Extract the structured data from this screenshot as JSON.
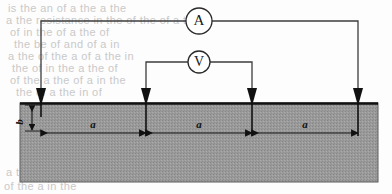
{
  "figure": {
    "ammeter_label": "A",
    "voltmeter_label": "V",
    "spacing_label": "a",
    "depth_label": "b",
    "spacings": [
      "a",
      "a",
      "a"
    ],
    "colors": {
      "ground_fill": "#9a9a9a",
      "ground_stipple": "#8c8c8c",
      "ground_border": "#5a5a5a",
      "surface_line": "#111111",
      "wire": "#3c3c3c",
      "electrode": "#111111",
      "dimension_line": "#111111",
      "page_background": "#fdfdfd",
      "ghost_text": "#c9c9c9"
    },
    "geometry": {
      "ground_rect": {
        "x": 20,
        "y": 103,
        "width": 358,
        "height": 79
      },
      "surface_y": 103,
      "electrodes_x": [
        41,
        146,
        252,
        358
      ],
      "ammeter_circle": {
        "cx": 199,
        "cy": 21,
        "r": 13
      },
      "voltmeter_circle": {
        "cx": 199,
        "cy": 62,
        "r": 11
      },
      "ammeter_wire_y": 21,
      "voltmeter_wire_y": 62,
      "dimension_line_y": 133,
      "depth_tick_y": 113
    }
  },
  "ghost_text": {
    "lines": [
      {
        "text": "is the an of a the a the",
        "x": 8,
        "y": 2
      },
      {
        "text": "a the resistance in the of the of a that",
        "x": 6,
        "y": 14
      },
      {
        "text": "of in the of a the of",
        "x": 10,
        "y": 26
      },
      {
        "text": "the be of and of a in",
        "x": 14,
        "y": 38
      },
      {
        "text": "a the of the a of a the in",
        "x": 8,
        "y": 50
      },
      {
        "text": "the of in the a the of",
        "x": 12,
        "y": 62
      },
      {
        "text": "of the a the of a in the",
        "x": 10,
        "y": 74
      },
      {
        "text": "the of a the in of",
        "x": 16,
        "y": 86
      },
      {
        "text": "a the of in",
        "x": 6,
        "y": 166
      },
      {
        "text": "of the a in the",
        "x": 4,
        "y": 180
      }
    ]
  }
}
